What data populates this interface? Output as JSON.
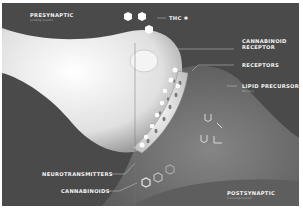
{
  "diagram": {
    "labels": {
      "presynaptic": "PRESYNAPTIC",
      "presynaptic_sub": "sending neuron",
      "thc": "THC",
      "thc_icon": "leaf-icon",
      "cannabinoid_receptor_line1": "CANNABINOID",
      "cannabinoid_receptor_line2": "RECEPTOR",
      "receptors": "RECEPTORS",
      "lipid_precursors": "LIPID PRECURSORS",
      "lipid_precursors_sub": "fat cells",
      "neurotransmitters": "NEUROTRANSMITTERS",
      "cannabinoids": "CANNABINOIDS",
      "postsynaptic": "POSTSYNAPTIC",
      "postsynaptic_sub": "receiving neuron"
    },
    "colors": {
      "background": "#4a4a4a",
      "presynaptic_neuron": "#e6e6e6",
      "postsynaptic_neuron": "#6e6e6e",
      "label_text": "#f2f2f2",
      "leader_line": "#cfcfcf"
    }
  }
}
